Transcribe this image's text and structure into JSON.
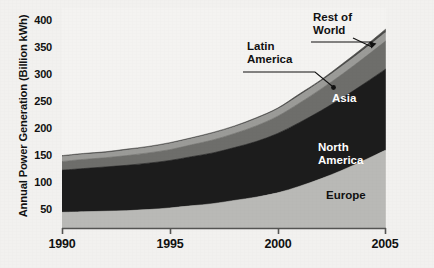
{
  "chart_data": {
    "type": "area",
    "title": "",
    "subtitle": "",
    "xlabel": "",
    "ylabel": "Annual Power Generation (Billion kWh)",
    "x": [
      1990,
      1991,
      1992,
      1993,
      1994,
      1995,
      1996,
      1997,
      1998,
      1999,
      2000,
      2001,
      2002,
      2003,
      2004,
      2005
    ],
    "xlim": [
      1990,
      2005
    ],
    "ylim": [
      0,
      400
    ],
    "xticks": [
      "1990",
      "1995",
      "2000",
      "2005"
    ],
    "xtick_values": [
      1990,
      1995,
      2000,
      2005
    ],
    "yticks": [
      "50",
      "100",
      "150",
      "200",
      "250",
      "300",
      "350",
      "400"
    ],
    "ytick_values": [
      50,
      100,
      150,
      200,
      250,
      300,
      350,
      400
    ],
    "grid": false,
    "legend_position": "in-plot-labels",
    "stacked": true,
    "series": [
      {
        "name": "Europe",
        "color": "#b9b9b6",
        "label_style": "dark",
        "values": [
          30,
          31,
          32,
          33,
          35,
          38,
          42,
          46,
          52,
          58,
          66,
          78,
          92,
          108,
          126,
          145
        ]
      },
      {
        "name": "North America",
        "color": "#1c1c1c",
        "label_style": "light",
        "values": [
          78,
          80,
          82,
          84,
          86,
          88,
          91,
          94,
          98,
          103,
          110,
          118,
          126,
          134,
          142,
          150
        ]
      },
      {
        "name": "Asia",
        "color": "#6e6e6b",
        "label_style": "light",
        "values": [
          16,
          17,
          17,
          18,
          19,
          20,
          22,
          24,
          26,
          29,
          32,
          36,
          40,
          44,
          48,
          52
        ]
      },
      {
        "name": "Latin America",
        "color": "#9b9b98",
        "label_style": "dark",
        "values": [
          9,
          9,
          9,
          10,
          10,
          11,
          11,
          12,
          12,
          13,
          13,
          14,
          14,
          15,
          15,
          16
        ]
      },
      {
        "name": "Rest of World",
        "color": "#4a4a48",
        "label_style": "dark",
        "values": [
          2,
          2,
          2,
          2,
          2,
          2,
          2,
          2,
          2,
          2,
          2,
          3,
          3,
          4,
          5,
          6
        ]
      }
    ],
    "totals": [
      135,
      139,
      142,
      147,
      152,
      159,
      168,
      178,
      190,
      205,
      223,
      249,
      275,
      305,
      336,
      369
    ],
    "annotations": [
      {
        "text": "Latin America",
        "type": "callout",
        "target_series": "Latin America"
      },
      {
        "text": "Rest of World",
        "type": "callout",
        "target_series": "Rest of World"
      },
      {
        "text": "Asia",
        "type": "inline",
        "target_series": "Asia"
      },
      {
        "text": "North America",
        "type": "inline",
        "target_series": "North America"
      },
      {
        "text": "Europe",
        "type": "inline",
        "target_series": "Europe"
      }
    ]
  },
  "axis": {
    "ylabel": "Annual Power Generation (Billion kWh)",
    "yticks": [
      "400",
      "350",
      "300",
      "250",
      "200",
      "150",
      "100",
      "50"
    ],
    "xticks": [
      "1990",
      "1995",
      "2000",
      "2005"
    ]
  },
  "labels": {
    "latin_america_line1": "Latin",
    "latin_america_line2": "America",
    "rest_of_world_line1": "Rest of",
    "rest_of_world_line2": "World",
    "asia": "Asia",
    "north_america_line1": "North",
    "north_america_line2": "America",
    "europe": "Europe"
  },
  "colors": {
    "europe": "#b9b9b6",
    "north_america": "#1c1c1c",
    "asia": "#6e6e6b",
    "latin_america": "#9b9b98",
    "rest_of_world": "#4a4a48",
    "background": "#f2f1ef",
    "axis": "#4a4a48",
    "text": "#111111"
  }
}
